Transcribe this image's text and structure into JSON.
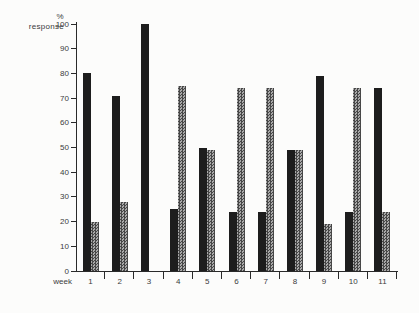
{
  "figure": {
    "y_axis_label_line1": "%",
    "y_axis_label_line2": "response",
    "x_axis_label": "week",
    "colors": {
      "background": "#fcfcfb",
      "axis": "#2a2a2a",
      "text": "#3b3b3b",
      "bar_black": "#1d1d1d",
      "hatch_dark": "#474747",
      "hatch_light": "#a9a9a9"
    }
  },
  "chart_data": {
    "type": "bar",
    "title": "",
    "xlabel": "week",
    "ylabel": "% response",
    "ylim": [
      0,
      100
    ],
    "yticks": [
      100,
      90,
      80,
      70,
      60,
      50,
      40,
      30,
      20,
      10,
      0
    ],
    "grid": false,
    "legend": "none",
    "categories": [
      "1",
      "2",
      "3",
      "4",
      "5",
      "6",
      "7",
      "8",
      "9",
      "10",
      "11"
    ],
    "series": [
      {
        "name": "solid-black",
        "style": "solid",
        "values": [
          80,
          71,
          100,
          25,
          50,
          24,
          24,
          49,
          79,
          24,
          74
        ]
      },
      {
        "name": "hatched-gray",
        "style": "hatched",
        "values": [
          20,
          28,
          0,
          75,
          49,
          74,
          74,
          49,
          19,
          74,
          24
        ]
      }
    ]
  }
}
